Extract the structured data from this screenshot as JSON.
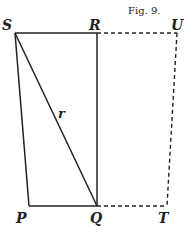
{
  "figure": {
    "caption": "Fig. 9.",
    "labels": {
      "S": "S",
      "R": "R",
      "U": "U",
      "P": "P",
      "Q": "Q",
      "T": "T",
      "r": "r"
    },
    "line_color": "#222222",
    "background": "#ffffff"
  }
}
